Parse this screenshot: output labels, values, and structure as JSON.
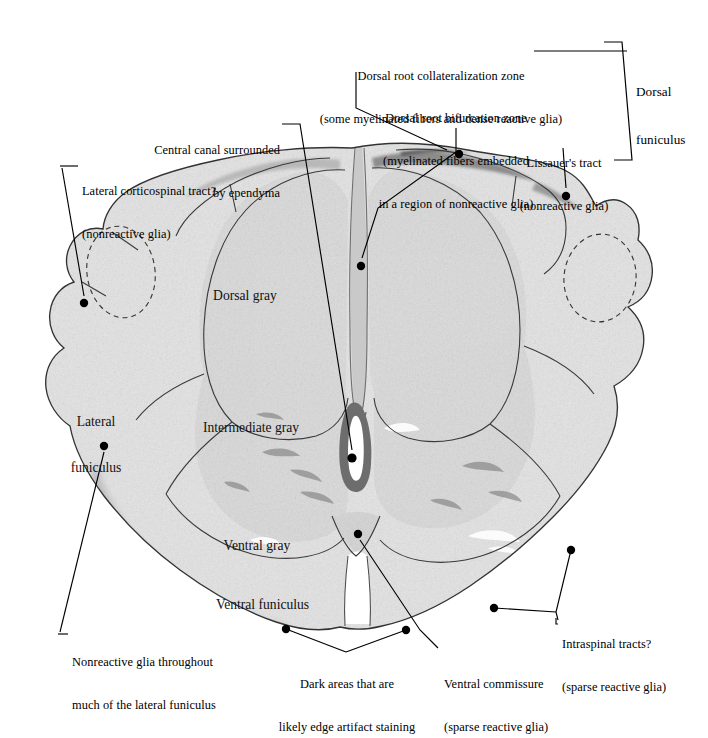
{
  "figure": {
    "type": "annotated-histology",
    "stain_description": "grayscale photomicrograph"
  },
  "annotations": {
    "dorsal_root_collateralization": {
      "line1": "Dorsal root collateralization zone",
      "line2": "(some myelinated fibers and dense reactive glia)"
    },
    "dorsal_root_bifurcation": {
      "line1": "Dorsal root bifurcation zone",
      "line2": "(myelinated fibers embedded",
      "line3": "in a region of nonreactive glia)"
    },
    "lissauers_tract": {
      "line1": "Lissauer's tract",
      "line2": "(nonreactive glia)"
    },
    "dorsal_funiculus": {
      "line1": "Dorsal",
      "line2": "funiculus"
    },
    "central_canal": {
      "line1": "Central canal surrounded",
      "line2": "by ependyma"
    },
    "lateral_corticospinal": {
      "line1": "Lateral corticospinal tract?",
      "line2": "(nonreactive glia)"
    },
    "nonreactive_glia_lateral": {
      "line1": "Nonreactive glia throughout",
      "line2": "much of the lateral funiculus"
    },
    "dark_areas": {
      "line1": "Dark areas that are",
      "line2": "likely edge artifact staining"
    },
    "ventral_commissure": {
      "line1": "Ventral commissure",
      "line2": "(sparse reactive glia)"
    },
    "intraspinal_tracts": {
      "line1": "Intraspinal tracts?",
      "line2": "(sparse reactive glia)"
    }
  },
  "tissue_labels": {
    "dorsal_gray": "Dorsal gray",
    "intermediate_gray": "Intermediate gray",
    "ventral_gray": "Ventral gray",
    "ventral_funiculus": "Ventral funiculus",
    "lateral_funiculus_l1": "Lateral",
    "lateral_funiculus_l2": "funiculus"
  },
  "colors": {
    "ink": "#000000",
    "background": "#ffffff",
    "tissue_light": "#e3e3e3",
    "tissue_mid": "#cfcfcf",
    "tissue_dark": "#9a9a9a",
    "edge_artifact": "#8e8e8e",
    "outline": "#2b2b2b"
  }
}
